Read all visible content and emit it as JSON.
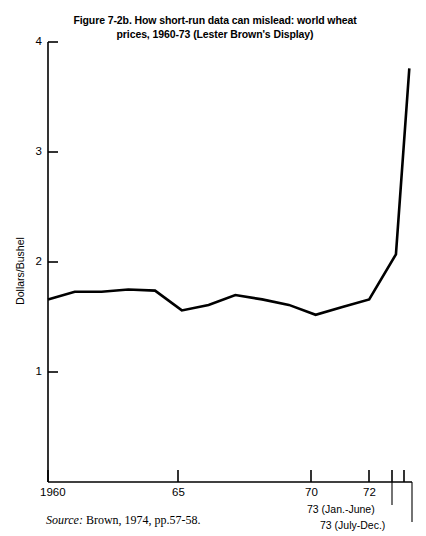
{
  "figure": {
    "title_line1": "Figure 7-2b. How short-run data can mislead: world wheat",
    "title_line2": "prices, 1960-73 (Lester Brown's Display)",
    "source_word": "Source:",
    "source_text": " Brown, 1974, pp.57-58.",
    "line_color": "#000000",
    "background_color": "#ffffff"
  },
  "chart_data": {
    "type": "line",
    "title": "Figure 7-2b. How short-run data can mislead: world wheat prices, 1960-73 (Lester Brown's Display)",
    "xlabel": "",
    "ylabel": "Dollars/Bushel",
    "ylim": [
      0,
      4
    ],
    "xlim": [
      1960,
      1973.6
    ],
    "grid": false,
    "legend": null,
    "y_ticks": [
      1,
      2,
      3,
      4
    ],
    "y_tick_labels": [
      "1",
      "2",
      "3",
      "4"
    ],
    "x_ticks": [
      1960,
      1965,
      1970,
      1972,
      1973,
      1973.5
    ],
    "x_tick_labels": [
      "1960",
      "65",
      "70",
      "72",
      "",
      ""
    ],
    "x_extra_labels": [
      "73 (Jan.-June)",
      "73 (July-Dec.)"
    ],
    "x": [
      1960,
      1961,
      1962,
      1963,
      1964,
      1965,
      1966,
      1967,
      1968,
      1969,
      1970,
      1971,
      1972,
      1973,
      1973.5
    ],
    "values": [
      1.66,
      1.73,
      1.73,
      1.75,
      1.74,
      1.56,
      1.61,
      1.7,
      1.66,
      1.61,
      1.52,
      1.59,
      1.66,
      2.07,
      3.76
    ],
    "series": [
      {
        "name": "World wheat price",
        "values": [
          1.66,
          1.73,
          1.73,
          1.75,
          1.74,
          1.56,
          1.61,
          1.7,
          1.66,
          1.61,
          1.52,
          1.59,
          1.66,
          2.07,
          3.76
        ]
      }
    ]
  },
  "axes": {
    "y_title": "Dollars/Bushel",
    "y_labels": [
      "4",
      "3",
      "2",
      "1"
    ],
    "x_labels": [
      "1960",
      "65",
      "70",
      "72"
    ],
    "period_label_1": "73 (Jan.-June)",
    "period_label_2": "73 (July-Dec.)"
  }
}
